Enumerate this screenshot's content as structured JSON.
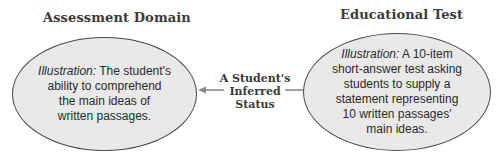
{
  "diagram": {
    "left": {
      "heading": "Assessment Domain",
      "illustration_label": "Illustration:",
      "lines": [
        "The student's",
        "ability to comprehend",
        "the main ideas of",
        "written passages."
      ]
    },
    "right": {
      "heading": "Educational Test",
      "illustration_label": "Illustration:",
      "lines": [
        "A 10-item",
        "short-answer test asking",
        "students to supply a",
        "statement representing",
        "10 written passages'",
        "main ideas."
      ]
    },
    "connector": {
      "lines": [
        "A Student's",
        "Inferred",
        "Status"
      ],
      "direction": "right-to-left",
      "arrow_icon": "arrow-left-icon"
    },
    "colors": {
      "ellipse_fill": "#e9e9e9",
      "ellipse_stroke": "#4a4a4a",
      "arrow": "#8a8a8a",
      "heading_text": "#3a3a3a"
    }
  }
}
